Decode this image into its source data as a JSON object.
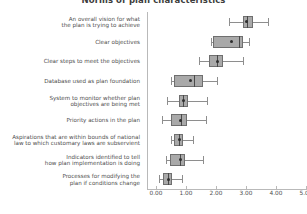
{
  "chart": {
    "title": "Norms of plan characteristics",
    "xlabel": "",
    "ylabel": ""
  },
  "axis": {
    "x_ticks": [
      "0.00",
      "1.00",
      "2.00",
      "3.00",
      "4.00",
      "5.00"
    ]
  },
  "chart_data": {
    "type": "box",
    "title": "Norms of plan characteristics",
    "xlabel": "",
    "ylabel": "",
    "xlim": [
      -0.3,
      5.05
    ],
    "x_ticks": [
      0.0,
      1.0,
      2.0,
      3.0,
      4.0,
      5.0
    ],
    "x_tick_labels": [
      "0.00",
      "1.00",
      "2.00",
      "3.00",
      "4.00",
      "5.00"
    ],
    "grid": false,
    "legend": "none",
    "orientation": "horizontal",
    "categories": [
      "An overall vision for what\nthe plan is trying to achieve",
      "Clear objectives",
      "Clear steps to meet the objectives",
      "Database used as plan foundation",
      "System to monitor whether plan\nobjectives are being met",
      "Priority actions in the plan",
      "Aspirations that are within bounds of national\nlaw to which customary laws are subservient",
      "Indicators identified to tell\nhow plan implementation is doing",
      "Processes for modifying the\nplan if conditions change"
    ],
    "boxes": [
      {
        "category": "An overall vision for what the plan is trying to achieve",
        "whisker_low": 2.44,
        "q1": 2.89,
        "median": 3.02,
        "q3": 3.22,
        "whisker_high": 3.74,
        "mean": 3.02
      },
      {
        "category": "Clear objectives",
        "whisker_low": 1.82,
        "q1": 1.89,
        "median": 2.78,
        "q3": 2.91,
        "whisker_high": 3.11,
        "mean": 2.53
      },
      {
        "category": "Clear steps to meet the objectives",
        "whisker_low": 1.42,
        "q1": 1.78,
        "median": 2.04,
        "q3": 2.24,
        "whisker_high": 2.89,
        "mean": 2.04
      },
      {
        "category": "Database used as plan foundation",
        "whisker_low": 0.49,
        "q1": 0.6,
        "median": 1.28,
        "q3": 1.58,
        "whisker_high": 2.02,
        "mean": 1.16
      },
      {
        "category": "System to monitor whether plan objectives are being met",
        "whisker_low": 0.38,
        "q1": 0.78,
        "median": 0.91,
        "q3": 1.08,
        "whisker_high": 1.71,
        "mean": 0.91
      },
      {
        "category": "Priority actions in the plan",
        "whisker_low": 0.21,
        "q1": 0.5,
        "median": 0.83,
        "q3": 1.02,
        "whisker_high": 1.66,
        "mean": 0.83
      },
      {
        "category": "Aspirations that are within bounds of national law to which customary laws are subservient",
        "whisker_low": 0.49,
        "q1": 0.6,
        "median": 0.78,
        "q3": 0.89,
        "whisker_high": 1.24,
        "mean": 0.78
      },
      {
        "category": "Indicators identified to tell how plan implementation is doing",
        "whisker_low": 0.33,
        "q1": 0.47,
        "median": 0.8,
        "q3": 0.97,
        "whisker_high": 1.58,
        "mean": 0.8
      },
      {
        "category": "Processes for modifying the plan if conditions change",
        "whisker_low": 0.1,
        "q1": 0.24,
        "median": 0.4,
        "q3": 0.52,
        "whisker_high": 0.86,
        "mean": 0.4
      }
    ]
  },
  "colors": {
    "box_fill": "#a9a9a9",
    "box_edge": "#6f6f6f",
    "whisker": "#8e8e8e",
    "median": "#4a4a4a",
    "mean": "#2e2e2e",
    "axis": "#b9b9b9",
    "text": "#4d4d4d",
    "background": "#ffffff"
  }
}
